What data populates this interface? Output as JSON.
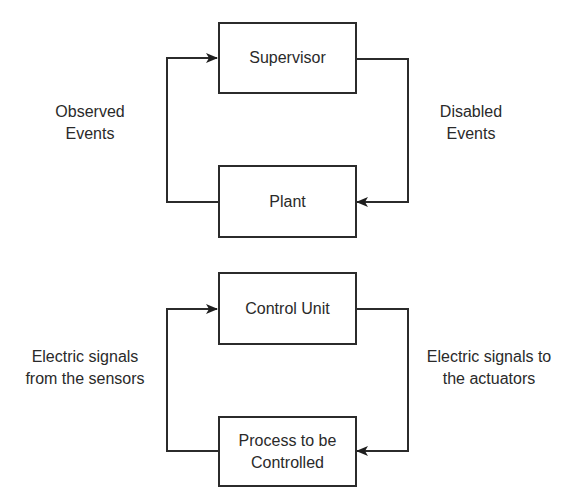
{
  "diagrams": [
    {
      "name": "supervisory-control-loop",
      "top_block": {
        "label": "Supervisor"
      },
      "bottom_block": {
        "label": "Plant"
      },
      "left_edge_label": {
        "line1": "Observed",
        "line2": "Events"
      },
      "right_edge_label": {
        "line1": "Disabled",
        "line2": "Events"
      },
      "edges": [
        {
          "from": "Plant",
          "to": "Supervisor",
          "label": "Observed Events",
          "side": "left"
        },
        {
          "from": "Supervisor",
          "to": "Plant",
          "label": "Disabled Events",
          "side": "right"
        }
      ]
    },
    {
      "name": "control-unit-loop",
      "top_block": {
        "label": "Control Unit"
      },
      "bottom_block": {
        "line1": "Process to be",
        "line2": "Controlled"
      },
      "left_edge_label": {
        "line1": "Electric signals",
        "line2": "from the sensors"
      },
      "right_edge_label": {
        "line1": "Electric signals to",
        "line2": "the actuators"
      },
      "edges": [
        {
          "from": "Process to be Controlled",
          "to": "Control Unit",
          "label": "Electric signals from the sensors",
          "side": "left"
        },
        {
          "from": "Control Unit",
          "to": "Process to be Controlled",
          "label": "Electric signals to the actuators",
          "side": "right"
        }
      ]
    }
  ],
  "colors": {
    "stroke": "#2b2b2b",
    "text": "#2a2a2a",
    "background": "#ffffff"
  }
}
